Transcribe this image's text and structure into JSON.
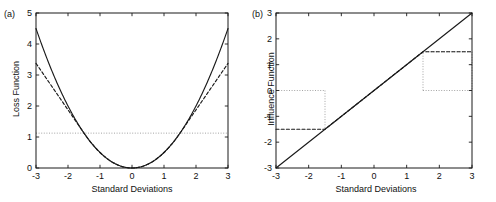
{
  "figure": {
    "background": "#ffffff",
    "ink": "#1a1a1a",
    "panels": [
      {
        "tag": "(a)",
        "xlabel": "Standard Deviations",
        "ylabel": "Loss Function"
      },
      {
        "tag": "(b)",
        "xlabel": "Standard Deviations",
        "ylabel": "Influence Function"
      }
    ]
  },
  "chart_data": [
    {
      "type": "line",
      "panel": "(a)",
      "title": "",
      "xlabel": "Standard Deviations",
      "ylabel": "Loss Function",
      "xlim": [
        -3,
        3
      ],
      "ylim": [
        0,
        5
      ],
      "xticks": [
        -3,
        -2,
        -1,
        0,
        1,
        2,
        3
      ],
      "yticks": [
        0,
        1,
        2,
        3,
        4,
        5
      ],
      "xticklabels": [
        "-3",
        "-2",
        "-1",
        "0",
        "1",
        "2",
        "3"
      ],
      "yticklabels": [
        "0",
        "1",
        "2",
        "3",
        "4",
        "5"
      ],
      "grid": false,
      "legend": null,
      "x": [
        -3,
        -2.75,
        -2.5,
        -2.25,
        -2,
        -1.75,
        -1.5,
        -1.25,
        -1,
        -0.75,
        -0.5,
        -0.25,
        0,
        0.25,
        0.5,
        0.75,
        1,
        1.25,
        1.5,
        1.75,
        2,
        2.25,
        2.5,
        2.75,
        3
      ],
      "series": [
        {
          "name": "quadratic-loss",
          "style": "solid",
          "values": [
            4.5,
            3.781,
            3.125,
            2.531,
            2.0,
            1.531,
            1.125,
            0.781,
            0.5,
            0.281,
            0.125,
            0.031,
            0.0,
            0.031,
            0.125,
            0.281,
            0.5,
            0.781,
            1.125,
            1.531,
            2.0,
            2.531,
            3.125,
            3.781,
            4.5
          ]
        },
        {
          "name": "huber-loss",
          "style": "dashed",
          "clip_k": 1.5,
          "values": [
            3.375,
            3.0,
            2.625,
            2.25,
            1.875,
            1.5,
            1.125,
            0.781,
            0.5,
            0.281,
            0.125,
            0.031,
            0.0,
            0.031,
            0.125,
            0.281,
            0.5,
            0.781,
            1.125,
            1.5,
            1.875,
            2.25,
            2.625,
            3.0,
            3.375
          ]
        }
      ],
      "annotations": [
        {
          "name": "reference-level",
          "style": "dotted",
          "orientation": "horizontal",
          "y": 1.125,
          "x_from": -3,
          "x_to": 3
        }
      ]
    },
    {
      "type": "line",
      "panel": "(b)",
      "title": "",
      "xlabel": "Standard Deviations",
      "ylabel": "Influence Function",
      "xlim": [
        -3,
        3
      ],
      "ylim": [
        -3,
        3
      ],
      "xticks": [
        -3,
        -2,
        -1,
        0,
        1,
        2,
        3
      ],
      "yticks": [
        -3,
        -2,
        -1,
        0,
        1,
        2,
        3
      ],
      "xticklabels": [
        "-3",
        "-2",
        "-1",
        "0",
        "1",
        "2",
        "3"
      ],
      "yticklabels": [
        "-3",
        "-2",
        "-1",
        "0",
        "1",
        "2",
        "3"
      ],
      "grid": false,
      "legend": null,
      "x": [
        -3,
        -1.5,
        0,
        1.5,
        3
      ],
      "series": [
        {
          "name": "linear-influence",
          "style": "solid",
          "values": [
            -3,
            -1.5,
            0,
            1.5,
            3
          ]
        },
        {
          "name": "bounded-influence",
          "style": "dashed",
          "clip_k": 1.5,
          "values": [
            -1.5,
            -1.5,
            0,
            1.5,
            1.5
          ]
        }
      ],
      "annotations": [
        {
          "name": "left-guide-box",
          "style": "dotted",
          "x_from": -3,
          "x_to": -1.5,
          "y_from": -1.5,
          "y_to": 0
        },
        {
          "name": "right-guide-box",
          "style": "dotted",
          "x_from": 1.5,
          "x_to": 3,
          "y_from": 0,
          "y_to": 1.5
        }
      ]
    }
  ]
}
